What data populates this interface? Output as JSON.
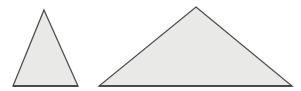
{
  "canvas": {
    "width": 301,
    "height": 91,
    "background_color": "#ffffff",
    "title": "Two Triangles"
  },
  "style": {
    "fill_color": "#e9e9e7",
    "stroke_color": "#4f4f4f",
    "base_stroke_color": "#3d3d3d",
    "stroke_width": 1.3,
    "base_stroke_width": 1.6
  },
  "shapes": [
    {
      "name": "small-triangle",
      "label": "Small tall triangle",
      "type": "triangle",
      "points": "44,10 78,86 13,86",
      "vertices": [
        {
          "label": "apex",
          "x": 44,
          "y": 10
        },
        {
          "label": "bottom-right",
          "x": 78,
          "y": 86
        },
        {
          "label": "bottom-left",
          "x": 13,
          "y": 86
        }
      ],
      "base_line": {
        "x1": 13,
        "y1": 86,
        "x2": 78,
        "y2": 86
      },
      "base_width": 65,
      "height": 76,
      "fill_color": "#e9e9e7",
      "stroke_color": "#4f4f4f"
    },
    {
      "name": "large-triangle",
      "label": "Large wide triangle",
      "type": "triangle",
      "points": "196,7 292,86 99,86",
      "vertices": [
        {
          "label": "apex",
          "x": 196,
          "y": 7
        },
        {
          "label": "bottom-right",
          "x": 292,
          "y": 86
        },
        {
          "label": "bottom-left",
          "x": 99,
          "y": 86
        }
      ],
      "base_line": {
        "x1": 99,
        "y1": 86,
        "x2": 292,
        "y2": 86
      },
      "base_width": 193,
      "height": 79,
      "fill_color": "#e9e9e7",
      "stroke_color": "#4f4f4f"
    }
  ]
}
